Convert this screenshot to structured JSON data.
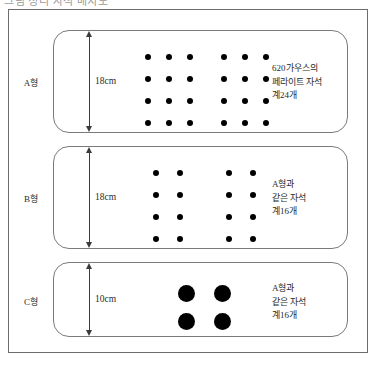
{
  "figure": {
    "top_caption": "그림 정리 자석 배치도",
    "panels": [
      {
        "id": "a",
        "type_label": "A형",
        "dimension": "18cm",
        "note_lines": [
          "620가우스의",
          "페라이트 자석",
          "계24개"
        ],
        "dot_groups": [
          {
            "name": "grid-a-left",
            "columns": 3,
            "rows": 4,
            "dot_size": "small",
            "count": 12
          },
          {
            "name": "grid-a-right",
            "columns": 3,
            "rows": 4,
            "dot_size": "small",
            "count": 12
          }
        ],
        "total_magnets": 24
      },
      {
        "id": "b",
        "type_label": "B형",
        "dimension": "18cm",
        "note_lines": [
          "A형과",
          "같은 자석",
          "계16개"
        ],
        "dot_groups": [
          {
            "name": "grid-b-left",
            "columns": 2,
            "rows": 4,
            "dot_size": "small",
            "count": 8
          },
          {
            "name": "grid-b-right",
            "columns": 2,
            "rows": 4,
            "dot_size": "small",
            "count": 8
          }
        ],
        "total_magnets": 16
      },
      {
        "id": "c",
        "type_label": "C형",
        "dimension": "10cm",
        "note_lines": [
          "A형과",
          "같은 자석",
          "계16개"
        ],
        "dot_groups": [
          {
            "name": "grid-c",
            "columns": 2,
            "rows": 2,
            "dot_size": "large",
            "count": 4
          }
        ],
        "total_magnets": 16
      }
    ]
  },
  "colors": {
    "dot": "#000000",
    "frame_border": "#6d6d6d",
    "panel_border": "#7a7a7a",
    "text": "#2b2b2b",
    "background": "#ffffff"
  }
}
